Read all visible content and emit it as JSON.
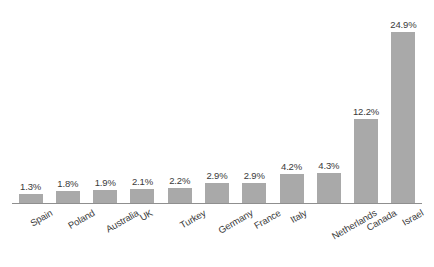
{
  "chart_data": {
    "type": "bar",
    "title": "",
    "subtitle": "",
    "xlabel": "",
    "ylabel": "",
    "categories": [
      "Spain",
      "Poland",
      "Australia",
      "UK",
      "Turkey",
      "Germany",
      "France",
      "Italy",
      "Netherlands",
      "Canada",
      "Israel"
    ],
    "values": [
      1.3,
      1.8,
      1.9,
      2.1,
      2.2,
      2.9,
      2.9,
      4.2,
      4.3,
      12.2,
      24.9
    ],
    "value_labels": [
      "1.3%",
      "1.8%",
      "1.9%",
      "2.1%",
      "2.2%",
      "2.9%",
      "2.9%",
      "4.2%",
      "4.3%",
      "12.2%",
      "24.9%"
    ],
    "ylim": [
      0,
      24.9
    ],
    "grid": false,
    "legend": false,
    "legend_position": "none",
    "y_axis_visible": false,
    "x_axis_visible": true,
    "value_labels_shown": true,
    "x_tick_label_rotation": -30,
    "colors": {
      "bar_fill": "#a9a9a9",
      "axis_line": "#8f8f8f",
      "label_text": "#3a3a3a",
      "value_text": "#3a3a3a",
      "background": "#ffffff"
    }
  }
}
